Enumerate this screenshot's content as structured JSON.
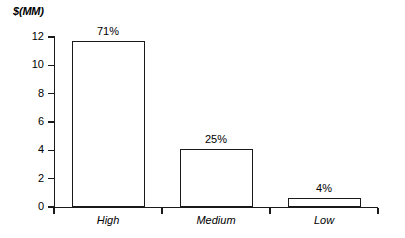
{
  "chart_data": {
    "type": "bar",
    "title": "",
    "subtitle": "",
    "xlabel": "",
    "ylabel": "$(MM)",
    "categories": [
      "High",
      "Medium",
      "Low"
    ],
    "values": [
      11.7,
      4.1,
      0.65
    ],
    "data_labels": [
      "71%",
      "25%",
      "4%"
    ],
    "ylim": [
      0,
      12
    ],
    "y_ticks": [
      "0",
      "2",
      "4",
      "6",
      "8",
      "10",
      "12"
    ],
    "y_tick_values": [
      0,
      2,
      4,
      6,
      8,
      10,
      12
    ],
    "grid": false,
    "legend": false,
    "legend_position": "none",
    "bar_fill_color": "#ffffff",
    "bar_border_color": "#1a1a1a",
    "axis_color": "#1a1a1a",
    "background_color": "#ffffff"
  },
  "axis": {
    "unit_label": "$(MM)"
  }
}
